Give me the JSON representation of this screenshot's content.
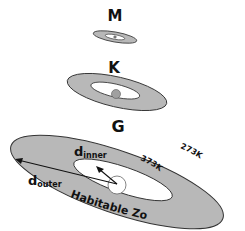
{
  "diagram": {
    "stars": [
      {
        "label": "M"
      },
      {
        "label": "K"
      },
      {
        "label": "G"
      }
    ],
    "annotations": {
      "d_inner_base": "d",
      "d_inner_sub": "inner",
      "d_outer_base": "d",
      "d_outer_sub": "outer",
      "inner_temp": "373K",
      "outer_temp": "273K",
      "zone_label": "Habitable Zone"
    },
    "colors": {
      "zone_fill": "#b8b8b8",
      "outline": "#333333",
      "inner_fill": "#ffffff",
      "star_fill": "#a0a0a0"
    }
  }
}
